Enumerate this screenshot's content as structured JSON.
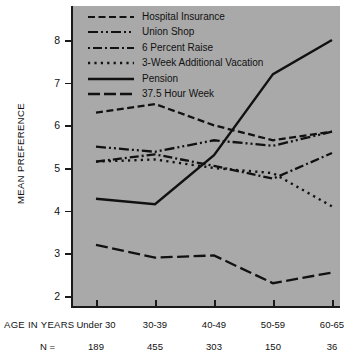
{
  "chart_data": {
    "type": "line",
    "title": "",
    "subtitle": "",
    "xlabel": "AGE IN YEARS",
    "ylabel": "MEAN PREFERENCE",
    "categories": [
      "Under 30",
      "30-39",
      "40-49",
      "50-59",
      "60-65"
    ],
    "sample_sizes_label": "N =",
    "sample_sizes": [
      189,
      455,
      303,
      150,
      36
    ],
    "ylim": [
      2,
      8.3
    ],
    "yticks": [
      2,
      3,
      4,
      5,
      6,
      7,
      8
    ],
    "ytick_labels": [
      "2",
      "3",
      "4",
      "5",
      "6",
      "7",
      "8"
    ],
    "grid": false,
    "legend_position": "top-left-inside",
    "series": [
      {
        "name": "Hospital Insurance",
        "style": "dashed",
        "values": [
          6.3,
          6.5,
          6.0,
          5.65,
          5.85
        ]
      },
      {
        "name": "Union Shop",
        "style": "dash-dot-dot",
        "values": [
          5.5,
          5.38,
          5.65,
          5.52,
          5.85
        ]
      },
      {
        "name": "6 Percent Raise",
        "style": "dash-dot",
        "values": [
          5.15,
          5.32,
          5.05,
          4.75,
          5.35
        ]
      },
      {
        "name": "3-Week Additional Vacation",
        "style": "dotted",
        "values": [
          5.15,
          5.2,
          5.0,
          4.88,
          4.1
        ]
      },
      {
        "name": "Pension",
        "style": "solid",
        "values": [
          4.28,
          4.15,
          5.3,
          7.2,
          8.0
        ]
      },
      {
        "name": "37.5 Hour Week",
        "style": "long-dash",
        "values": [
          3.2,
          2.9,
          2.95,
          2.3,
          2.55
        ]
      }
    ],
    "line_color": "#111111",
    "panel_color": "#a9a9a9"
  },
  "legend": {
    "items": [
      {
        "label": "Hospital Insurance",
        "icon": "dashed-line-icon"
      },
      {
        "label": "Union Shop",
        "icon": "dash-dot-dot-line-icon"
      },
      {
        "label": "6 Percent Raise",
        "icon": "dash-dot-line-icon"
      },
      {
        "label": "3-Week Additional Vacation",
        "icon": "dotted-line-icon"
      },
      {
        "label": "Pension",
        "icon": "solid-line-icon"
      },
      {
        "label": "37.5 Hour Week",
        "icon": "long-dash-line-icon"
      }
    ]
  },
  "axes": {
    "y_title": "MEAN PREFERENCE",
    "x_title": "AGE IN YEARS",
    "n_row_label": "N =",
    "y_ticks": [
      "8",
      "7",
      "6",
      "5",
      "4",
      "3",
      "2"
    ],
    "x_ticks": [
      "Under 30",
      "30-39",
      "40-49",
      "50-59",
      "60-65"
    ],
    "n_values": [
      "189",
      "455",
      "303",
      "150",
      "36"
    ]
  }
}
